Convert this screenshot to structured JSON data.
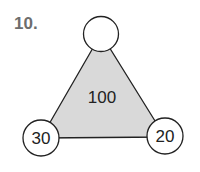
{
  "problem": {
    "number": "10."
  },
  "triangle": {
    "center_value": "100",
    "fill_color": "#d9d9d9",
    "stroke_color": "#222222"
  },
  "circles": {
    "top": {
      "value": ""
    },
    "bottom_left": {
      "value": "30"
    },
    "bottom_right": {
      "value": "20"
    }
  }
}
